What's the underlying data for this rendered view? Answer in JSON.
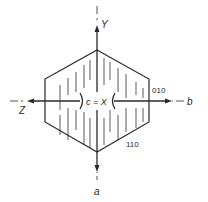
{
  "diagram": {
    "type": "crystal-optical-orientation",
    "axes": {
      "vertical_top_label": "Y",
      "vertical_bottom_label": "a",
      "horizontal_left_label": "Z",
      "horizontal_right_label": "b",
      "center_label": "c = X"
    },
    "faces": {
      "right_face": "010",
      "lower_right_face": "110"
    },
    "colors": {
      "line": "#2a2a2a",
      "hatch": "#555555",
      "background": "#ffffff"
    }
  }
}
